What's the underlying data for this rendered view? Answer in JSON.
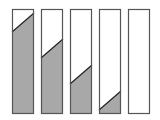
{
  "diagram": {
    "colors": {
      "fill": "#a8a8a8",
      "border": "#555555",
      "empty": "#ffffff",
      "diagonal": "#222222"
    },
    "bar_top": 9,
    "bar_bottom": 114,
    "bar_width": 22,
    "bars": [
      {
        "x": 12,
        "left_y": 32,
        "right_y": 13
      },
      {
        "x": 41,
        "left_y": 58,
        "right_y": 39
      },
      {
        "x": 70,
        "left_y": 84,
        "right_y": 65
      },
      {
        "x": 99,
        "left_y": 110,
        "right_y": 91
      },
      {
        "x": 128,
        "left_y": null,
        "right_y": null
      }
    ]
  }
}
